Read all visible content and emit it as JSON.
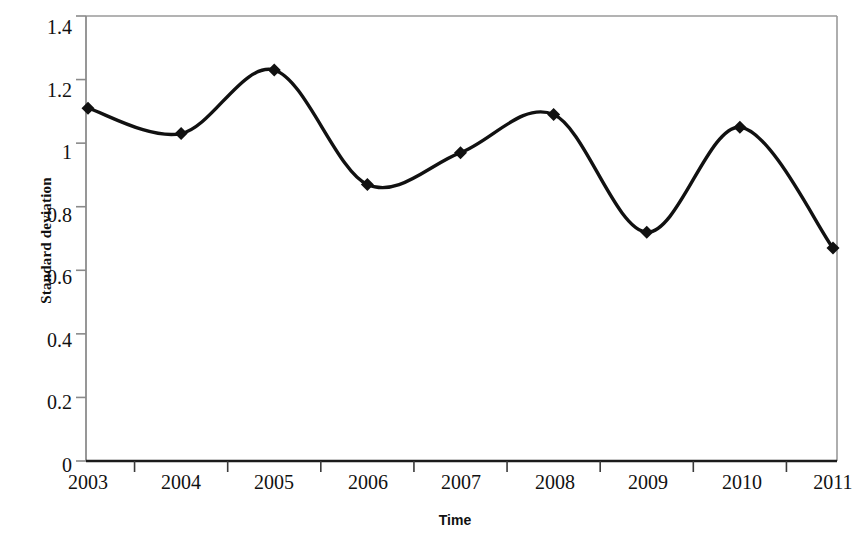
{
  "chart_data": {
    "type": "line",
    "title": "",
    "xlabel": "Time",
    "ylabel": "Standard deviation",
    "categories": [
      "2003",
      "2004",
      "2005",
      "2006",
      "2007",
      "2008",
      "2009",
      "2010",
      "2011"
    ],
    "values": [
      1.11,
      1.03,
      1.23,
      0.87,
      0.97,
      1.09,
      0.72,
      1.05,
      0.67
    ],
    "series": [
      {
        "name": "Standard deviation",
        "values": [
          1.11,
          1.03,
          1.23,
          0.87,
          0.97,
          1.09,
          0.72,
          1.05,
          0.67
        ]
      }
    ],
    "ylim": [
      0,
      1.4
    ],
    "ytick_labels": [
      "0",
      "0.2",
      "0.4",
      "0.6",
      "0.8",
      "1",
      "1.2",
      "1.4"
    ],
    "ytick_values": [
      0,
      0.2,
      0.4,
      0.6,
      0.8,
      1,
      1.2,
      1.4
    ],
    "grid": false,
    "legend": null,
    "legend_position": "none",
    "smoothing": "spline",
    "marker": "diamond",
    "line_color": "#111111",
    "marker_color": "#111111",
    "axis_color": "#8a8a8a",
    "background_color": "#ffffff"
  }
}
